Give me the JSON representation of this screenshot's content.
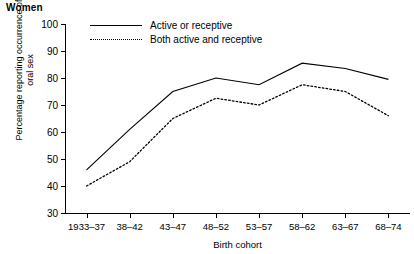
{
  "panel": {
    "title": "Women"
  },
  "axes": {
    "ylabel_line1": "Percentage reporting occurrence of",
    "ylabel_line2": "oral sex",
    "xlabel": "Birth cohort",
    "yticks": [
      "30",
      "40",
      "50",
      "60",
      "70",
      "80",
      "90",
      "100"
    ]
  },
  "legend": {
    "items": [
      {
        "label": "Active or receptive",
        "style": "solid"
      },
      {
        "label": "Both active and receptive",
        "style": "dotted"
      }
    ]
  },
  "chart_data": {
    "type": "line",
    "title": "Women",
    "xlabel": "Birth cohort",
    "ylabel": "Percentage reporting occurrence of oral sex",
    "categories": [
      "1933–37",
      "38–42",
      "43–47",
      "48–52",
      "53–57",
      "58–62",
      "63–67",
      "68–74"
    ],
    "ylim": [
      30,
      100
    ],
    "ytick_step": 10,
    "grid": false,
    "legend_position": "top-left-inside",
    "series": [
      {
        "name": "Active or receptive",
        "style": "solid",
        "color": "#000000",
        "values": [
          46,
          61,
          75,
          80,
          77.5,
          85.5,
          83.5,
          79.5
        ]
      },
      {
        "name": "Both active and receptive",
        "style": "dotted",
        "color": "#000000",
        "values": [
          40,
          49,
          65,
          72.5,
          70,
          77.5,
          75,
          66
        ]
      }
    ]
  }
}
